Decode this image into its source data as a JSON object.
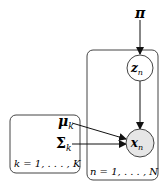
{
  "diagram": {
    "type": "graphical-model-plate-notation",
    "nodes": {
      "pi": {
        "label": "π",
        "observed": false,
        "shape": "none"
      },
      "z": {
        "label": "z",
        "sub": "n",
        "observed": false,
        "shape": "circle"
      },
      "x": {
        "label": "x",
        "sub": "n",
        "observed": true,
        "shape": "circle",
        "fill": "#e6e6e6"
      },
      "mu": {
        "label": "μ",
        "sub": "k",
        "shape": "none"
      },
      "sigma": {
        "label": "Σ",
        "sub": "k",
        "shape": "none"
      }
    },
    "edges": [
      {
        "from": "pi",
        "to": "z"
      },
      {
        "from": "z",
        "to": "x"
      },
      {
        "from": "mu",
        "to": "x"
      },
      {
        "from": "sigma",
        "to": "x"
      }
    ],
    "plates": {
      "n": {
        "label": "n = 1, . . . , N"
      },
      "k": {
        "label": "k = 1, . . . , K"
      }
    },
    "colors": {
      "stroke": "#333333",
      "observed_fill": "#e6e6e6"
    }
  }
}
